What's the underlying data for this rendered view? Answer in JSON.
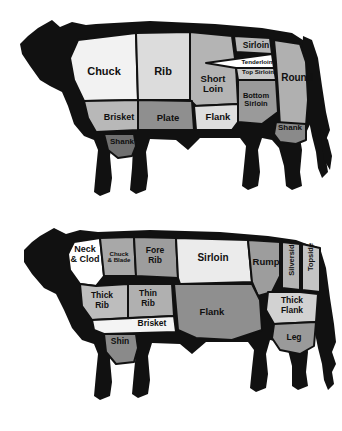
{
  "figure": {
    "caption": "",
    "background": "#ffffff",
    "outline_color": "#111111",
    "label_color": "#101010"
  },
  "palette": {
    "black": "#111111",
    "white": "#ffffff",
    "near_white": "#f2f2f2",
    "light": "#dcdcdc",
    "light_mid": "#c9c9c9",
    "mid": "#a8a8a8",
    "mid_dark": "#8f8f8f",
    "dark": "#7c7c7c"
  },
  "diagrams": [
    {
      "id": "american-beef-cuts",
      "name": "American beef cuts",
      "cuts": [
        {
          "id": "chuck",
          "label": "Chuck",
          "fill": "#f2f2f2",
          "x": 104,
          "y": 72,
          "size": 11,
          "rotate": 0,
          "lines": [
            "Chuck"
          ]
        },
        {
          "id": "rib",
          "label": "Rib",
          "fill": "#dcdcdc",
          "x": 163,
          "y": 72,
          "size": 11,
          "rotate": 0,
          "lines": [
            "Rib"
          ]
        },
        {
          "id": "short-loin",
          "label": "Short Loin",
          "fill": "#b4b4b4",
          "x": 213,
          "y": 84,
          "size": 9.5,
          "rotate": 0,
          "lines": [
            "Short",
            "Loin"
          ]
        },
        {
          "id": "sirloin",
          "label": "Sirloin",
          "fill": "#b8b8b8",
          "x": 256,
          "y": 46,
          "size": 8.5,
          "rotate": 0,
          "lines": [
            "Sirloin"
          ]
        },
        {
          "id": "tenderloin",
          "label": "Tenderloin",
          "fill": "#ffffff",
          "x": 257,
          "y": 62,
          "size": 6.2,
          "rotate": 0,
          "lines": [
            "Tenderloin"
          ]
        },
        {
          "id": "top-sirloin",
          "label": "Top Sirloin",
          "fill": "#c9c9c9",
          "x": 258,
          "y": 72,
          "size": 6.2,
          "rotate": 0,
          "lines": [
            "Top Sirloin"
          ]
        },
        {
          "id": "bottom-sirloin",
          "label": "Bottom Sirloin",
          "fill": "#9a9a9a",
          "x": 256,
          "y": 100,
          "size": 7.5,
          "rotate": 0,
          "lines": [
            "Bottom",
            "Sirloin"
          ]
        },
        {
          "id": "round",
          "label": "Round",
          "fill": "#b0b0b0",
          "x": 297,
          "y": 78,
          "size": 10,
          "rotate": 0,
          "lines": [
            "Round"
          ]
        },
        {
          "id": "brisket",
          "label": "Brisket",
          "fill": "#b8b8b8",
          "x": 119,
          "y": 118,
          "size": 9,
          "rotate": 0,
          "lines": [
            "Brisket"
          ]
        },
        {
          "id": "plate",
          "label": "Plate",
          "fill": "#8f8f8f",
          "x": 168,
          "y": 118,
          "size": 9.5,
          "rotate": 0,
          "lines": [
            "Plate"
          ]
        },
        {
          "id": "flank",
          "label": "Flank",
          "fill": "#dedede",
          "x": 218,
          "y": 117,
          "size": 9.5,
          "rotate": 0,
          "lines": [
            "Flank"
          ]
        },
        {
          "id": "shank-front",
          "label": "Shank",
          "fill": "#6f6f6f",
          "x": 122,
          "y": 142,
          "size": 8,
          "rotate": 0,
          "lines": [
            "Shank"
          ]
        },
        {
          "id": "shank-rear",
          "label": "Shank",
          "fill": "#8a8a8a",
          "x": 290,
          "y": 128,
          "size": 8,
          "rotate": 0,
          "lines": [
            "Shank"
          ]
        }
      ]
    },
    {
      "id": "british-beef-cuts",
      "name": "British beef cuts",
      "cuts": [
        {
          "id": "neck-and-clod",
          "label": "Neck & Clod",
          "fill": "#ffffff",
          "x": 85,
          "y": 41,
          "size": 9,
          "rotate": 0,
          "lines": [
            "Neck",
            "& Clod"
          ]
        },
        {
          "id": "chuck-and-blade",
          "label": "Chuck & Blade",
          "fill": "#a8a8a8",
          "x": 119,
          "y": 43,
          "size": 6.2,
          "rotate": 0,
          "lines": [
            "Chuck",
            "& Blade"
          ]
        },
        {
          "id": "fore-rib",
          "label": "Fore Rib",
          "fill": "#9d9d9d",
          "x": 155,
          "y": 42,
          "size": 8.5,
          "rotate": 0,
          "lines": [
            "Fore",
            "Rib"
          ]
        },
        {
          "id": "sirloin-uk",
          "label": "Sirloin",
          "fill": "#ebebeb",
          "x": 213,
          "y": 44,
          "size": 10,
          "rotate": 0,
          "lines": [
            "Sirloin"
          ]
        },
        {
          "id": "rump",
          "label": "Rump",
          "fill": "#9d9d9d",
          "x": 266,
          "y": 48,
          "size": 9.5,
          "rotate": 0,
          "lines": [
            "Rump"
          ]
        },
        {
          "id": "silverside",
          "label": "Silverside",
          "fill": "#b4b4b4",
          "x": 292,
          "y": 44,
          "size": 7.5,
          "rotate": -90,
          "lines": [
            "Silverside"
          ]
        },
        {
          "id": "topside",
          "label": "Topside",
          "fill": "#c4c4c4",
          "x": 311,
          "y": 43,
          "size": 7.5,
          "rotate": -90,
          "lines": [
            "Topside"
          ]
        },
        {
          "id": "thick-rib",
          "label": "Thick Rib",
          "fill": "#bdbdbd",
          "x": 102,
          "y": 87,
          "size": 8.5,
          "rotate": 0,
          "lines": [
            "Thick",
            "Rib"
          ]
        },
        {
          "id": "thin-rib",
          "label": "Thin Rib",
          "fill": "#b0b0b0",
          "x": 148,
          "y": 85,
          "size": 8.5,
          "rotate": 0,
          "lines": [
            "Thin",
            "Rib"
          ]
        },
        {
          "id": "brisket-uk",
          "label": "Brisket",
          "fill": "#f4f4f4",
          "x": 152,
          "y": 110,
          "size": 8.5,
          "rotate": 0,
          "lines": [
            "Brisket"
          ]
        },
        {
          "id": "flank-uk",
          "label": "Flank",
          "fill": "#8f8f8f",
          "x": 212,
          "y": 98,
          "size": 9.5,
          "rotate": 0,
          "lines": [
            "Flank"
          ]
        },
        {
          "id": "thick-flank",
          "label": "Thick Flank",
          "fill": "#d2d2d2",
          "x": 292,
          "y": 92,
          "size": 8.5,
          "rotate": 0,
          "lines": [
            "Thick",
            "Flank"
          ]
        },
        {
          "id": "leg",
          "label": "Leg",
          "fill": "#9a9a9a",
          "x": 294,
          "y": 124,
          "size": 8.5,
          "rotate": 0,
          "lines": [
            "Leg"
          ]
        },
        {
          "id": "shin",
          "label": "Shin",
          "fill": "#8a8a8a",
          "x": 120,
          "y": 128,
          "size": 8.5,
          "rotate": 0,
          "lines": [
            "Shin"
          ]
        }
      ]
    }
  ]
}
